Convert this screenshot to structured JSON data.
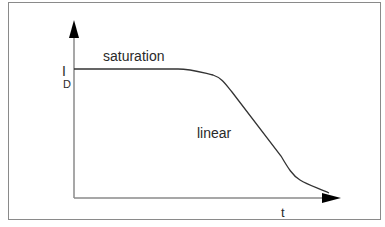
{
  "diagram": {
    "y_axis_label": "I",
    "y_axis_subscript": "D",
    "x_axis_label": "t",
    "regions": [
      {
        "label": "saturation"
      },
      {
        "label": "linear"
      }
    ],
    "colors": {
      "axis": "#8a8a8a",
      "curve": "#333333",
      "arrow": "#000000",
      "text": "#2a2a2a"
    }
  }
}
